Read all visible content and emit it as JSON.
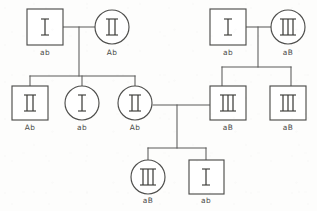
{
  "diagram": {
    "type": "pedigree",
    "canvas": {
      "width": 317,
      "height": 211,
      "background": "#fdfdfc"
    },
    "style": {
      "line_color": "#5a5a58",
      "shape_fill": "#ffffff",
      "shape_stroke": "#4e4e4c",
      "label_color": "#4a4a48"
    },
    "legend": {
      "square_meaning": "male",
      "circle_meaning": "female",
      "inner_symbol_meaning": "phenotype-roman-numeral",
      "below_label_meaning": "genotype-haplotype"
    }
  },
  "individuals": [
    {
      "id": "I-1",
      "shape": "square",
      "symbol": "I",
      "symbol_bars": 1,
      "genotype": "ab",
      "generation": 1,
      "family": "left",
      "cx": 45,
      "cy": 27
    },
    {
      "id": "I-2",
      "shape": "circle",
      "symbol": "II",
      "symbol_bars": 2,
      "genotype": "Ab",
      "generation": 1,
      "family": "left",
      "cx": 112,
      "cy": 27
    },
    {
      "id": "I-3",
      "shape": "square",
      "symbol": "I",
      "symbol_bars": 1,
      "genotype": "ab",
      "generation": 1,
      "family": "right",
      "cx": 227,
      "cy": 27
    },
    {
      "id": "I-4",
      "shape": "circle",
      "symbol": "III",
      "symbol_bars": 3,
      "genotype": "aB",
      "generation": 1,
      "family": "right",
      "cx": 288,
      "cy": 27
    },
    {
      "id": "II-1",
      "shape": "square",
      "symbol": "II",
      "symbol_bars": 2,
      "genotype": "Ab",
      "generation": 2,
      "family": "left",
      "cx": 30,
      "cy": 103
    },
    {
      "id": "II-2",
      "shape": "circle",
      "symbol": "I",
      "symbol_bars": 1,
      "genotype": "ab",
      "generation": 2,
      "family": "left",
      "cx": 82,
      "cy": 103
    },
    {
      "id": "II-3",
      "shape": "circle",
      "symbol": "II",
      "symbol_bars": 2,
      "genotype": "Ab",
      "generation": 2,
      "family": "left",
      "cx": 135,
      "cy": 103
    },
    {
      "id": "II-4",
      "shape": "square",
      "symbol": "III",
      "symbol_bars": 3,
      "genotype": "aB",
      "generation": 2,
      "family": "right",
      "cx": 228,
      "cy": 103
    },
    {
      "id": "II-5",
      "shape": "square",
      "symbol": "III",
      "symbol_bars": 3,
      "genotype": "aB",
      "generation": 2,
      "family": "right",
      "cx": 288,
      "cy": 103
    },
    {
      "id": "III-1",
      "shape": "circle",
      "symbol": "III",
      "symbol_bars": 3,
      "genotype": "aB",
      "generation": 3,
      "family": "union",
      "cx": 148,
      "cy": 177
    },
    {
      "id": "III-2",
      "shape": "square",
      "symbol": "I",
      "symbol_bars": 1,
      "genotype": "ab",
      "generation": 3,
      "family": "union",
      "cx": 206,
      "cy": 177
    }
  ],
  "unions": [
    {
      "id": "union-left",
      "partners": [
        "I-1",
        "I-2"
      ],
      "children": [
        "II-1",
        "II-2",
        "II-3"
      ]
    },
    {
      "id": "union-right",
      "partners": [
        "I-3",
        "I-4"
      ],
      "children": [
        "II-4",
        "II-5"
      ]
    },
    {
      "id": "union-mid",
      "partners": [
        "II-3",
        "II-4"
      ],
      "children": [
        "III-1",
        "III-2"
      ]
    }
  ],
  "genotype_labels": {
    "I-1": "ab",
    "I-2": "Ab",
    "I-3": "ab",
    "I-4": "aB",
    "II-1": "Ab",
    "II-2": "ab",
    "II-3": "Ab",
    "II-4": "aB",
    "II-5": "aB",
    "III-1": "aB",
    "III-2": "ab"
  }
}
